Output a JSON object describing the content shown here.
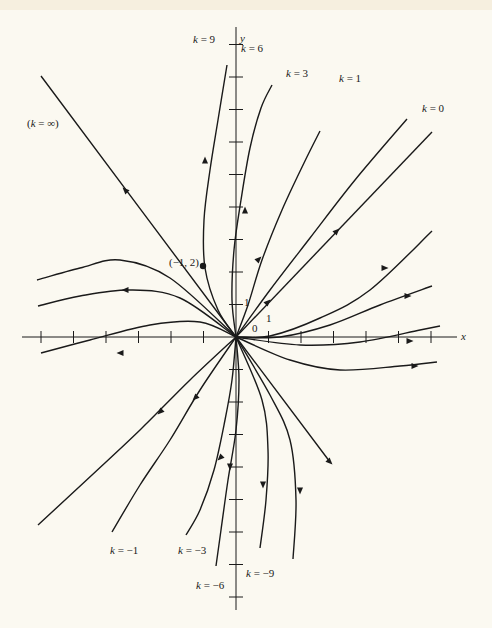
{
  "figure": {
    "axis_labels": {
      "x": "x",
      "y": "y"
    },
    "origin_label": "0",
    "unit_x_label": "1",
    "unit_y_label": "1",
    "point": {
      "label": "(−1, 2)",
      "x": 203,
      "y": 266
    },
    "origin_px": {
      "x": 236,
      "y": 337
    },
    "unit_px": 32.5,
    "colors": {
      "ink": "#1a1a1a",
      "paper": "#fbf9f1",
      "strip": "#f6efdf"
    },
    "curve_labels": [
      {
        "text": "k = 9",
        "x": 193,
        "y": 33
      },
      {
        "text": "k = 6",
        "x": 241,
        "y": 42
      },
      {
        "text": "k = 3",
        "x": 286,
        "y": 67
      },
      {
        "text": "k = 1",
        "x": 339,
        "y": 72
      },
      {
        "text": "k = 0",
        "x": 422,
        "y": 102
      },
      {
        "text": "(k = ∞)",
        "x": 27,
        "y": 117
      },
      {
        "text": "k = −1",
        "x": 110,
        "y": 544
      },
      {
        "text": "k = −3",
        "x": 178,
        "y": 544
      },
      {
        "text": "k = −6",
        "x": 196,
        "y": 579
      },
      {
        "text": "k = −9",
        "x": 246,
        "y": 567
      }
    ]
  },
  "chart_data": {
    "type": "line",
    "title": "",
    "xlabel": "x",
    "ylabel": "y",
    "grid": false,
    "xlim": [
      -6.5,
      6.5
    ],
    "ylim": [
      -8.5,
      9.5
    ],
    "special_point": {
      "label": "(-1, 2)",
      "x": -1,
      "y": 2
    },
    "series": [
      {
        "name": "k = ∞",
        "path": [
          [
            41,
            76
          ],
          [
            236,
            337
          ],
          [
            330,
            462
          ]
        ],
        "arrows": [
          [
            125,
            190,
            "up-left"
          ],
          [
            330,
            462,
            "down-right"
          ]
        ]
      },
      {
        "name": "k = 0",
        "path": [
          [
            236,
            337
          ],
          [
            432,
            132
          ]
        ],
        "arrows": [
          [
            337,
            231,
            "up-right"
          ]
        ]
      },
      {
        "name": "k = 1",
        "path": [
          [
            236,
            337
          ],
          [
            270,
            290
          ],
          [
            310,
            238
          ],
          [
            355,
            180
          ],
          [
            407,
            119
          ]
        ],
        "arrows": [
          [
            268,
            302,
            "up-right"
          ]
        ]
      },
      {
        "name": "k = 3",
        "path": [
          [
            236,
            337
          ],
          [
            248,
            305
          ],
          [
            262,
            260
          ],
          [
            282,
            210
          ],
          [
            304,
            163
          ],
          [
            320,
            131
          ]
        ],
        "arrows": [
          [
            259,
            259,
            "up-right"
          ]
        ]
      },
      {
        "name": "k = 6",
        "path": [
          [
            236,
            337
          ],
          [
            232,
            300
          ],
          [
            234,
            250
          ],
          [
            241,
            200
          ],
          [
            250,
            148
          ],
          [
            261,
            108
          ],
          [
            272,
            85
          ]
        ],
        "arrows": [
          [
            245,
            210,
            "up"
          ]
        ]
      },
      {
        "name": "k = 9",
        "path": [
          [
            236,
            337
          ],
          [
            218,
            310
          ],
          [
            205,
            268
          ],
          [
            204,
            220
          ],
          [
            210,
            170
          ],
          [
            218,
            120
          ],
          [
            227,
            65
          ]
        ],
        "arrows": [
          [
            205,
            160,
            "up"
          ]
        ]
      },
      {
        "name": "k = -1 branch (left-upper)",
        "path": [
          [
            41,
            353
          ],
          [
            90,
            340
          ],
          [
            150,
            325
          ],
          [
            200,
            322
          ],
          [
            236,
            337
          ]
        ],
        "arrows": [
          [
            120,
            353,
            "left"
          ]
        ]
      },
      {
        "name": "k = -3 branch (left-upper)",
        "path": [
          [
            38,
            306
          ],
          [
            80,
            296
          ],
          [
            130,
            290
          ],
          [
            180,
            298
          ],
          [
            236,
            337
          ]
        ],
        "arrows": [
          [
            125,
            290,
            "left"
          ]
        ]
      },
      {
        "name": "k = -6 branch (left-upper)",
        "path": [
          [
            37,
            280
          ],
          [
            80,
            268
          ],
          [
            120,
            260
          ],
          [
            170,
            278
          ],
          [
            236,
            337
          ]
        ],
        "arrows": []
      },
      {
        "name": "k = -1",
        "path": [
          [
            236,
            337
          ],
          [
            190,
            380
          ],
          [
            140,
            430
          ],
          [
            92,
            475
          ],
          [
            38,
            525
          ]
        ],
        "arrows": [
          [
            160,
            412,
            "down-left"
          ]
        ]
      },
      {
        "name": "k = -3",
        "path": [
          [
            236,
            337
          ],
          [
            200,
            390
          ],
          [
            170,
            440
          ],
          [
            140,
            485
          ],
          [
            112,
            532
          ]
        ],
        "arrows": [
          [
            195,
            398,
            "down-left"
          ]
        ]
      },
      {
        "name": "k = -6",
        "path": [
          [
            236,
            337
          ],
          [
            232,
            380
          ],
          [
            225,
            420
          ],
          [
            214,
            470
          ],
          [
            200,
            510
          ],
          [
            186,
            535
          ]
        ],
        "arrows": [
          [
            220,
            458,
            "down-left"
          ]
        ]
      },
      {
        "name": "k = -9",
        "path": [
          [
            236,
            337
          ],
          [
            239,
            380
          ],
          [
            236,
            430
          ],
          [
            228,
            480
          ],
          [
            221,
            530
          ],
          [
            216,
            566
          ]
        ],
        "arrows": [
          [
            230,
            467,
            "down"
          ]
        ]
      },
      {
        "name": "k = -3 branch (right-lower)",
        "path": [
          [
            236,
            337
          ],
          [
            262,
            400
          ],
          [
            268,
            450
          ],
          [
            266,
            500
          ],
          [
            260,
            548
          ]
        ],
        "arrows": [
          [
            263,
            485,
            "down"
          ]
        ]
      },
      {
        "name": "k = -6 branch (right-lower)",
        "path": [
          [
            236,
            337
          ],
          [
            270,
            395
          ],
          [
            290,
            440
          ],
          [
            296,
            500
          ],
          [
            293,
            559
          ]
        ],
        "arrows": [
          [
            300,
            491,
            "down"
          ]
        ]
      },
      {
        "name": "k = 1 branch (right-lower)",
        "path": [
          [
            236,
            337
          ],
          [
            290,
            360
          ],
          [
            340,
            370
          ],
          [
            400,
            366
          ],
          [
            437,
            362
          ]
        ],
        "arrows": [
          [
            415,
            366,
            "right"
          ]
        ]
      },
      {
        "name": "k = 3 branch (right-lower)",
        "path": [
          [
            236,
            337
          ],
          [
            300,
            345
          ],
          [
            360,
            342
          ],
          [
            420,
            330
          ],
          [
            440,
            326
          ]
        ],
        "arrows": [
          [
            410,
            341,
            "right"
          ]
        ]
      },
      {
        "name": "k = -1 branch (right-upper)",
        "path": [
          [
            236,
            337
          ],
          [
            280,
            337
          ],
          [
            330,
            325
          ],
          [
            380,
            305
          ],
          [
            432,
            286
          ]
        ],
        "arrows": [
          [
            408,
            296,
            "right"
          ]
        ]
      },
      {
        "name": "k = -3 branch (right-upper)",
        "path": [
          [
            236,
            337
          ],
          [
            270,
            336
          ],
          [
            320,
            318
          ],
          [
            370,
            290
          ],
          [
            432,
            231
          ]
        ],
        "arrows": [
          [
            385,
            268,
            "right"
          ]
        ]
      }
    ]
  }
}
